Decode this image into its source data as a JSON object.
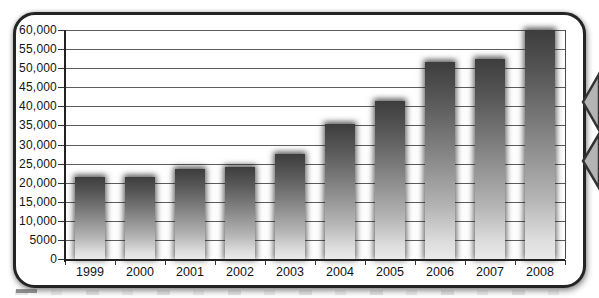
{
  "chart_data": {
    "type": "bar",
    "title": "",
    "xlabel": "",
    "ylabel": "",
    "categories": [
      "1999",
      "2000",
      "2001",
      "2002",
      "2003",
      "2004",
      "2005",
      "2006",
      "2007",
      "2008"
    ],
    "values": [
      21500,
      21500,
      23500,
      24000,
      27500,
      35500,
      41500,
      51500,
      52500,
      60000
    ],
    "ylim": [
      0,
      60000
    ],
    "ytick_step": 5000,
    "ytick_labels": [
      "60,000",
      "55,000",
      "50,000",
      "45,000",
      "40,000",
      "35,000",
      "30,000",
      "25,000",
      "20,000",
      "15,000",
      "10,000",
      "5000",
      "0"
    ],
    "grid": "horizontal",
    "legend": "none",
    "style": {
      "bar_gradient_top": "#3d3d3d",
      "bar_gradient_bottom": "#e9e9e9",
      "bar_glow": "soft dark halo around each bar",
      "gridline_color": "#5c5c5c",
      "axis_color": "#222222",
      "label_color": "#141414",
      "frame_border_color": "#242424",
      "frame_background": "#ffffff"
    }
  },
  "decorations": {
    "frame": "rounded-rectangle-border",
    "right_edge_icon": "double-chevron-left-icon",
    "bottom_text": "partially-cropped-caption-fragment"
  }
}
